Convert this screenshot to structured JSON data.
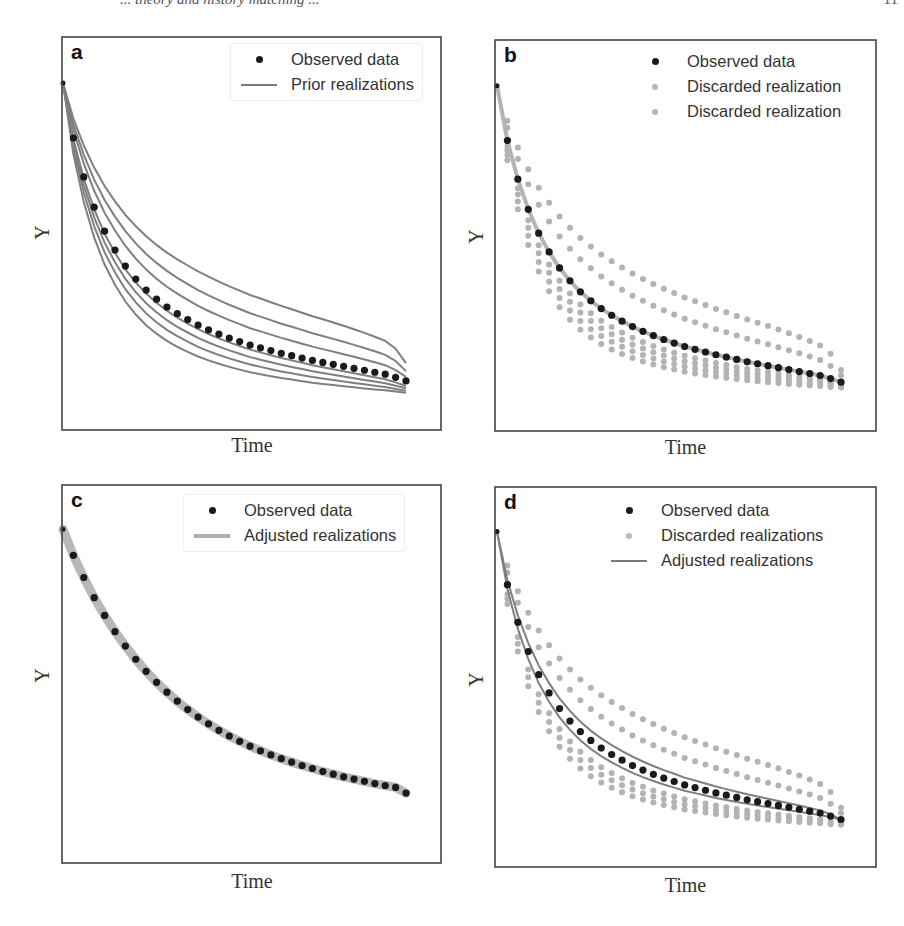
{
  "page": {
    "header_fragment": "... theory and history matching ...",
    "header_page": "11"
  },
  "colors": {
    "observed": "#1a1a1a",
    "prior_line": "#7f7f7f",
    "discarded": "#b3b3b3",
    "adjusted_band": "#b8b8b8",
    "adjusted_line": "#7a7a7a",
    "frame": "#444444"
  },
  "axes": {
    "xlabel": "Time",
    "ylabel": "Y"
  },
  "panels": [
    {
      "id": "a",
      "letter": "a",
      "legend": [
        {
          "key": "dot",
          "label": "Observed data"
        },
        {
          "key": "line",
          "label": "Prior realizations"
        }
      ]
    },
    {
      "id": "b",
      "letter": "b",
      "legend": [
        {
          "key": "dot",
          "label": "Observed data"
        },
        {
          "key": "dot-gray",
          "label": "Discarded realization"
        },
        {
          "key": "dot-gray",
          "label": "Discarded realization"
        }
      ]
    },
    {
      "id": "c",
      "letter": "c",
      "legend": [
        {
          "key": "dot",
          "label": "Observed data"
        },
        {
          "key": "line-thick",
          "label": "Adjusted realizations"
        }
      ]
    },
    {
      "id": "d",
      "letter": "d",
      "legend": [
        {
          "key": "dot",
          "label": "Observed data"
        },
        {
          "key": "dot-gray",
          "label": "Discarded realizations"
        },
        {
          "key": "line",
          "label": "Adjusted realizations"
        }
      ]
    }
  ],
  "chart_data": [
    {
      "type": "line",
      "panel": "a",
      "title": "",
      "xlabel": "Time",
      "ylabel": "Y",
      "xlim": [
        0,
        34
      ],
      "ylim": [
        0,
        1
      ],
      "grid": false,
      "ticks": "none",
      "legend_position": "upper right",
      "legend": [
        "Observed data",
        "Prior realizations"
      ],
      "x": [
        0,
        1,
        2,
        3,
        4,
        5,
        6,
        7,
        8,
        9,
        10,
        11,
        12,
        13,
        14,
        15,
        16,
        17,
        18,
        19,
        20,
        21,
        22,
        23,
        24,
        25,
        26,
        27,
        28,
        29,
        30,
        31,
        32,
        33
      ],
      "series": [
        {
          "name": "Observed data",
          "style": "scatter",
          "values": [
            0.883,
            0.743,
            0.644,
            0.567,
            0.506,
            0.458,
            0.417,
            0.384,
            0.356,
            0.333,
            0.313,
            0.296,
            0.281,
            0.267,
            0.255,
            0.244,
            0.234,
            0.225,
            0.216,
            0.209,
            0.202,
            0.195,
            0.189,
            0.183,
            0.177,
            0.172,
            0.167,
            0.162,
            0.157,
            0.152,
            0.147,
            0.142,
            0.134,
            0.125
          ]
        },
        {
          "name": "Prior realizations",
          "style": "line",
          "count": 7,
          "decay_scales": [
            0.78,
            0.86,
            0.93,
            1.0,
            1.18,
            1.32,
            1.5
          ],
          "end_values": [
            0.095,
            0.1,
            0.106,
            0.112,
            0.135,
            0.15,
            0.17
          ]
        }
      ]
    },
    {
      "type": "scatter",
      "panel": "b",
      "title": "",
      "xlabel": "Time",
      "ylabel": "Y",
      "xlim": [
        0,
        34
      ],
      "ylim": [
        0,
        1
      ],
      "grid": false,
      "ticks": "none",
      "legend_position": "upper right",
      "legend": [
        "Observed data",
        "Discarded realization",
        "Discarded realization"
      ],
      "x": [
        0,
        1,
        2,
        3,
        4,
        5,
        6,
        7,
        8,
        9,
        10,
        11,
        12,
        13,
        14,
        15,
        16,
        17,
        18,
        19,
        20,
        21,
        22,
        23,
        24,
        25,
        26,
        27,
        28,
        29,
        30,
        31,
        32,
        33
      ],
      "series": [
        {
          "name": "Observed data",
          "style": "scatter",
          "values": [
            0.883,
            0.743,
            0.644,
            0.567,
            0.506,
            0.458,
            0.417,
            0.384,
            0.356,
            0.333,
            0.313,
            0.296,
            0.281,
            0.267,
            0.255,
            0.244,
            0.234,
            0.225,
            0.216,
            0.209,
            0.202,
            0.195,
            0.189,
            0.183,
            0.177,
            0.172,
            0.167,
            0.162,
            0.157,
            0.152,
            0.147,
            0.142,
            0.134,
            0.125
          ]
        },
        {
          "name": "Discarded realization (upper)",
          "style": "scatter",
          "decay_scales": [
            1.3,
            1.55
          ]
        },
        {
          "name": "Discarded realization (lower)",
          "style": "scatter",
          "decay_scales": [
            0.72,
            0.78,
            0.84,
            0.9
          ]
        }
      ]
    },
    {
      "type": "line",
      "panel": "c",
      "title": "",
      "xlabel": "Time",
      "ylabel": "Y",
      "xlim": [
        0,
        34
      ],
      "ylim": [
        0,
        1
      ],
      "grid": false,
      "ticks": "none",
      "legend_position": "upper right",
      "legend": [
        "Observed data",
        "Adjusted realizations"
      ],
      "x": [
        0,
        1,
        2,
        3,
        4,
        5,
        6,
        7,
        8,
        9,
        10,
        11,
        12,
        13,
        14,
        15,
        16,
        17,
        18,
        19,
        20,
        21,
        22,
        23,
        24,
        25,
        26,
        27,
        28,
        29,
        30,
        31,
        32,
        33
      ],
      "series": [
        {
          "name": "Observed data",
          "style": "scatter",
          "values": [
            0.883,
            0.814,
            0.755,
            0.702,
            0.655,
            0.612,
            0.574,
            0.539,
            0.507,
            0.478,
            0.452,
            0.428,
            0.406,
            0.386,
            0.368,
            0.351,
            0.336,
            0.322,
            0.309,
            0.297,
            0.286,
            0.276,
            0.267,
            0.258,
            0.25,
            0.242,
            0.235,
            0.228,
            0.222,
            0.216,
            0.21,
            0.205,
            0.2,
            0.185
          ]
        },
        {
          "name": "Adjusted realizations",
          "style": "band",
          "band_width": 0.02
        }
      ]
    },
    {
      "type": "line",
      "panel": "d",
      "title": "",
      "xlabel": "Time",
      "ylabel": "Y",
      "xlim": [
        0,
        34
      ],
      "ylim": [
        0,
        1
      ],
      "grid": false,
      "ticks": "none",
      "legend_position": "upper right",
      "legend": [
        "Observed data",
        "Discarded realizations",
        "Adjusted realizations"
      ],
      "x": [
        0,
        1,
        2,
        3,
        4,
        5,
        6,
        7,
        8,
        9,
        10,
        11,
        12,
        13,
        14,
        15,
        16,
        17,
        18,
        19,
        20,
        21,
        22,
        23,
        24,
        25,
        26,
        27,
        28,
        29,
        30,
        31,
        32,
        33
      ],
      "series": [
        {
          "name": "Observed data",
          "style": "scatter",
          "values": [
            0.883,
            0.743,
            0.644,
            0.567,
            0.506,
            0.458,
            0.417,
            0.384,
            0.356,
            0.333,
            0.313,
            0.296,
            0.281,
            0.267,
            0.255,
            0.244,
            0.234,
            0.225,
            0.216,
            0.209,
            0.202,
            0.195,
            0.189,
            0.183,
            0.177,
            0.172,
            0.167,
            0.162,
            0.157,
            0.152,
            0.147,
            0.142,
            0.134,
            0.125
          ]
        },
        {
          "name": "Discarded realizations",
          "style": "scatter",
          "decay_scales": [
            0.72,
            0.78,
            0.84,
            1.3,
            1.55
          ]
        },
        {
          "name": "Adjusted realizations",
          "style": "line",
          "count": 2,
          "decay_scales": [
            0.92,
            1.1
          ]
        }
      ]
    }
  ]
}
